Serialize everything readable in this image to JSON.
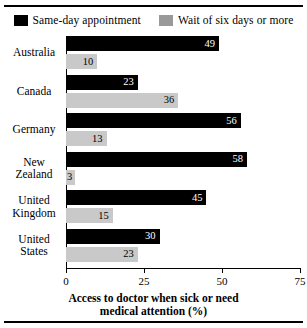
{
  "chart_data": {
    "type": "bar",
    "orientation": "horizontal",
    "title": "",
    "xlabel": "Access to doctor when sick or need medical attention (%)",
    "ylabel": "",
    "xlim": [
      0,
      75
    ],
    "xticks": [
      0,
      25,
      50,
      75
    ],
    "grid": false,
    "legend_position": "top",
    "categories": [
      "Australia",
      "Canada",
      "Germany",
      "New Zealand",
      "United Kingdom",
      "United States"
    ],
    "series": [
      {
        "name": "Same-day appointment",
        "color": "#000000",
        "values": [
          49,
          23,
          56,
          58,
          45,
          30
        ]
      },
      {
        "name": "Wait of six days or more",
        "color": "#c9c9c9",
        "values": [
          10,
          36,
          13,
          3,
          15,
          23
        ]
      }
    ]
  },
  "legend": {
    "items": [
      {
        "label": "Same-day appointment",
        "swatch": "black"
      },
      {
        "label": "Wait of six days or more",
        "swatch": "gray"
      }
    ]
  },
  "axis": {
    "x_title_line1": "Access to doctor when sick or need",
    "x_title_line2": "medical attention (%)",
    "ticks": [
      "0",
      "25",
      "50",
      "75"
    ]
  },
  "categories": [
    {
      "line1": "Australia",
      "line2": ""
    },
    {
      "line1": "Canada",
      "line2": ""
    },
    {
      "line1": "Germany",
      "line2": ""
    },
    {
      "line1": "New",
      "line2": "Zealand"
    },
    {
      "line1": "United",
      "line2": "Kingdom"
    },
    {
      "line1": "United",
      "line2": "States"
    }
  ]
}
